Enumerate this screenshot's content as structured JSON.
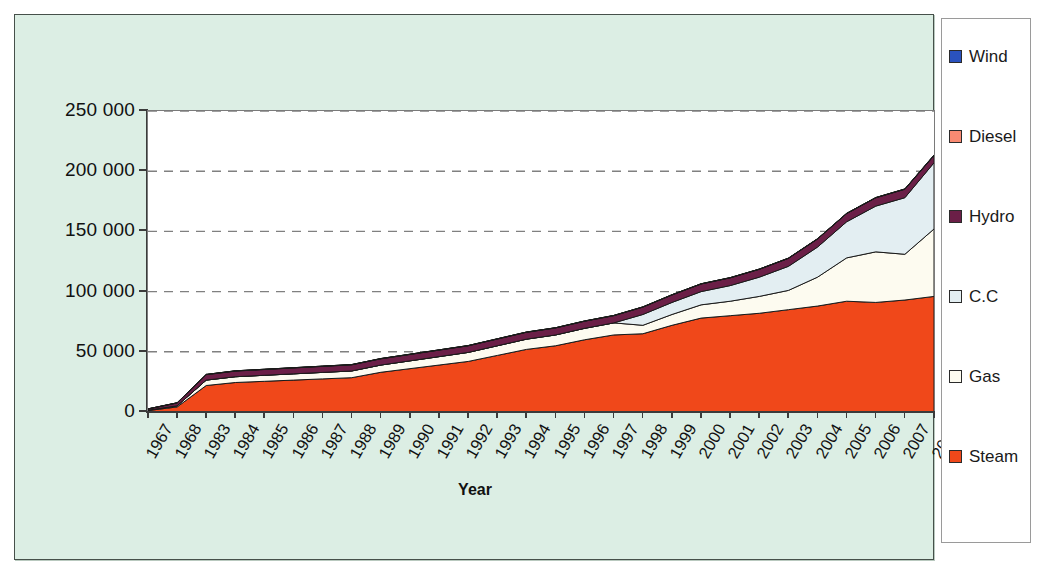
{
  "chart_data": {
    "type": "area",
    "stacked": true,
    "title": "",
    "subtitle": "",
    "xlabel": "Year",
    "ylabel": "",
    "ylim": [
      0,
      250000
    ],
    "ytick_values": [
      0,
      50000,
      100000,
      150000,
      200000,
      250000
    ],
    "ytick_labels": [
      "0",
      "50 000",
      "100 000",
      "150 000",
      "200 000",
      "250 000"
    ],
    "grid": "horizontal-dashed",
    "legend_position": "right",
    "categories": [
      "1967",
      "1968",
      "1983",
      "1984",
      "1985",
      "1986",
      "1987",
      "1988",
      "1989",
      "1990",
      "1991",
      "1992",
      "1993",
      "1994",
      "1995",
      "1996",
      "1997",
      "1998",
      "1999",
      "2000",
      "2001",
      "2002",
      "2003",
      "2004",
      "2005",
      "2006",
      "2007",
      "2008"
    ],
    "series": [
      {
        "name": "Steam",
        "color": "#F0481A",
        "values": [
          1200,
          4200,
          22000,
          24500,
          25500,
          26500,
          27500,
          28500,
          33000,
          36000,
          39000,
          42000,
          47000,
          52000,
          55000,
          60000,
          64000,
          65000,
          72000,
          78000,
          80000,
          82000,
          85000,
          88000,
          92000,
          91000,
          93000,
          96000
        ]
      },
      {
        "name": "Gas",
        "color": "#FDFBF0",
        "values": [
          300,
          900,
          4500,
          4800,
          5000,
          5200,
          5400,
          5600,
          6000,
          6500,
          7000,
          7500,
          8000,
          8500,
          9000,
          9500,
          10000,
          7000,
          9000,
          11000,
          12000,
          14000,
          16000,
          24000,
          36000,
          42000,
          38000,
          56000
        ]
      },
      {
        "name": "C.C",
        "color": "#E3EEF2",
        "values": [
          0,
          0,
          0,
          0,
          0,
          0,
          0,
          0,
          0,
          0,
          0,
          0,
          0,
          0,
          0,
          0,
          0,
          9000,
          10000,
          11000,
          13000,
          16000,
          20000,
          25000,
          30000,
          38000,
          47000,
          55000
        ]
      },
      {
        "name": "Hydro",
        "color": "#6B1F47",
        "values": [
          1000,
          2400,
          4500,
          4700,
          4800,
          4900,
          5000,
          5100,
          5200,
          5300,
          5400,
          5500,
          5600,
          5700,
          5800,
          5900,
          6000,
          6100,
          6200,
          6300,
          6400,
          6500,
          6600,
          6700,
          6800,
          6900,
          7000,
          6000
        ]
      },
      {
        "name": "Diesel",
        "color": "#F98A72",
        "values": [
          100,
          150,
          200,
          200,
          200,
          200,
          200,
          200,
          200,
          200,
          200,
          200,
          200,
          200,
          200,
          200,
          200,
          200,
          200,
          200,
          200,
          200,
          200,
          200,
          200,
          200,
          200,
          200
        ]
      },
      {
        "name": "Wind",
        "color": "#2A52BE",
        "values": [
          0,
          0,
          0,
          0,
          0,
          0,
          0,
          0,
          0,
          0,
          0,
          0,
          0,
          0,
          0,
          0,
          0,
          0,
          0,
          0,
          0,
          0,
          0,
          0,
          0,
          0,
          100,
          300
        ]
      }
    ]
  },
  "legend": {
    "items": [
      {
        "label": "Wind",
        "color": "#2A52BE"
      },
      {
        "label": "Diesel",
        "color": "#F98A72"
      },
      {
        "label": "Hydro",
        "color": "#6B1F47"
      },
      {
        "label": "C.C",
        "color": "#E3EEF2"
      },
      {
        "label": "Gas",
        "color": "#FDFBF0"
      },
      {
        "label": "Steam",
        "color": "#F0481A"
      }
    ]
  },
  "colors": {
    "chart_background": "#DCEEE4",
    "plot_background": "#FFFFFF",
    "axis": "#3B3B3B",
    "gridline": "#808080",
    "page_background": "#FFFFFF"
  }
}
